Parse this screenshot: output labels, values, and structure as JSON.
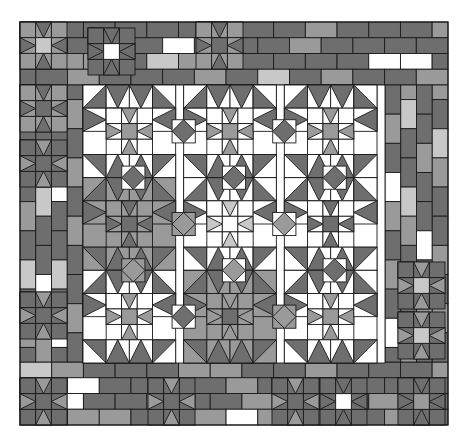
{
  "artwork": {
    "title": "Patchwork Quilt Pattern",
    "type": "quilt-diagram",
    "canvas": {
      "width": 467,
      "height": 442,
      "background": "#ffffff"
    },
    "quilt_bounds": {
      "x": 20,
      "y": 22,
      "width": 428,
      "height": 403
    }
  },
  "palette": {
    "white": "#ffffff",
    "light_gray": "#c8c8c8",
    "mid_gray": "#9a9a9a",
    "dark_gray": "#6e6e6e",
    "outline": "#1a1a1a",
    "names": [
      "white",
      "light_gray",
      "mid_gray",
      "dark_gray"
    ]
  },
  "layout": {
    "border": {
      "name": "brick-rail-border",
      "thickness": 63,
      "top_rows": 4,
      "bottom_rows": 4,
      "left_cols": 4,
      "right_cols": 4,
      "brick_long": 31.5,
      "brick_short": 15.7
    },
    "center": {
      "name": "nine-block-star-field",
      "x": 83,
      "y": 85,
      "width": 302,
      "height": 278,
      "rows": 3,
      "cols": 3,
      "block_size": 100.6,
      "block_name": "star-in-star-block",
      "sub_grid": 4
    },
    "accent_stars": {
      "name": "sawtooth-star-block",
      "size": 47,
      "count": 13,
      "positions": [
        {
          "x": 20,
          "y": 22,
          "body": "mid_gray",
          "star": "light_gray",
          "pts": "dark_gray"
        },
        {
          "x": 88,
          "y": 28,
          "body": "dark_gray",
          "star": "white",
          "pts": "dark_gray"
        },
        {
          "x": 196,
          "y": 22,
          "body": "mid_gray",
          "star": "dark_gray",
          "pts": "dark_gray"
        },
        {
          "x": 20,
          "y": 85,
          "body": "mid_gray",
          "star": "dark_gray",
          "pts": "dark_gray"
        },
        {
          "x": 20,
          "y": 140,
          "body": "dark_gray",
          "star": "dark_gray",
          "pts": "mid_gray"
        },
        {
          "x": 20,
          "y": 292,
          "body": "dark_gray",
          "star": "dark_gray",
          "pts": "mid_gray"
        },
        {
          "x": 398,
          "y": 262,
          "body": "dark_gray",
          "star": "light_gray",
          "pts": "mid_gray"
        },
        {
          "x": 398,
          "y": 312,
          "body": "dark_gray",
          "star": "light_gray",
          "pts": "mid_gray"
        },
        {
          "x": 398,
          "y": 378,
          "body": "dark_gray",
          "star": "mid_gray",
          "pts": "dark_gray"
        },
        {
          "x": 320,
          "y": 378,
          "body": "dark_gray",
          "star": "white",
          "pts": "dark_gray"
        },
        {
          "x": 272,
          "y": 378,
          "body": "dark_gray",
          "star": "dark_gray",
          "pts": "mid_gray"
        },
        {
          "x": 148,
          "y": 378,
          "body": "dark_gray",
          "star": "dark_gray",
          "pts": "mid_gray"
        },
        {
          "x": 20,
          "y": 378,
          "body": "dark_gray",
          "star": "dark_gray",
          "pts": "mid_gray"
        }
      ]
    }
  },
  "center_blocks": [
    {
      "row": 0,
      "col": 0,
      "ground": "white",
      "star_center": "mid_gray",
      "star_pts": "mid_gray",
      "geese": "dark_gray",
      "diamonds": "dark_gray",
      "corners": "white"
    },
    {
      "row": 0,
      "col": 1,
      "ground": "white",
      "star_center": "mid_gray",
      "star_pts": "mid_gray",
      "geese": "dark_gray",
      "diamonds": "dark_gray",
      "corners": "white"
    },
    {
      "row": 0,
      "col": 2,
      "ground": "white",
      "star_center": "mid_gray",
      "star_pts": "mid_gray",
      "geese": "dark_gray",
      "diamonds": "dark_gray",
      "corners": "white"
    },
    {
      "row": 1,
      "col": 0,
      "ground": "mid_gray",
      "star_center": "dark_gray",
      "star_pts": "dark_gray",
      "geese": "dark_gray",
      "diamonds": "mid_gray",
      "corners": "mid_gray"
    },
    {
      "row": 1,
      "col": 1,
      "ground": "white",
      "star_center": "white",
      "star_pts": "light_gray",
      "geese": "dark_gray",
      "diamonds": "mid_gray",
      "corners": "white"
    },
    {
      "row": 1,
      "col": 2,
      "ground": "white",
      "star_center": "dark_gray",
      "star_pts": "dark_gray",
      "geese": "dark_gray",
      "diamonds": "dark_gray",
      "corners": "white"
    },
    {
      "row": 2,
      "col": 0,
      "ground": "white",
      "star_center": "mid_gray",
      "star_pts": "mid_gray",
      "geese": "dark_gray",
      "diamonds": "dark_gray",
      "corners": "white"
    },
    {
      "row": 2,
      "col": 1,
      "ground": "mid_gray",
      "star_center": "dark_gray",
      "star_pts": "mid_gray",
      "geese": "dark_gray",
      "diamonds": "mid_gray",
      "corners": "mid_gray"
    },
    {
      "row": 2,
      "col": 2,
      "ground": "white",
      "star_center": "mid_gray",
      "star_pts": "mid_gray",
      "geese": "dark_gray",
      "diamonds": "dark_gray",
      "corners": "white"
    }
  ],
  "border_bricks": {
    "top": [
      [
        "mid_gray",
        "dark_gray",
        "dark_gray",
        "dark_gray",
        "dark_gray",
        "dark_gray",
        "mid_gray",
        "dark_gray",
        "dark_gray",
        "mid_gray",
        "dark_gray",
        "dark_gray",
        "dark_gray",
        "mid_gray"
      ],
      [
        "dark_gray",
        "dark_gray",
        "dark_gray",
        "mid_gray",
        "dark_gray",
        "white",
        "light_gray",
        "dark_gray",
        "dark_gray",
        "mid_gray",
        "dark_gray",
        "dark_gray",
        "dark_gray",
        "dark_gray"
      ],
      [
        "dark_gray",
        "mid_gray",
        "mid_gray",
        "dark_gray",
        "light_gray",
        "mid_gray",
        "light_gray",
        "dark_gray",
        "dark_gray",
        "dark_gray",
        "dark_gray",
        "white",
        "white",
        "dark_gray"
      ],
      [
        "dark_gray",
        "dark_gray",
        "mid_gray",
        "dark_gray",
        "dark_gray",
        "dark_gray",
        "mid_gray",
        "dark_gray",
        "light_gray",
        "dark_gray",
        "mid_gray",
        "dark_gray",
        "dark_gray",
        "mid_gray"
      ]
    ],
    "bottom": [
      [
        "light_gray",
        "mid_gray",
        "dark_gray",
        "dark_gray",
        "dark_gray",
        "mid_gray",
        "mid_gray",
        "dark_gray",
        "dark_gray",
        "mid_gray",
        "dark_gray",
        "dark_gray",
        "dark_gray",
        "mid_gray"
      ],
      [
        "dark_gray",
        "dark_gray",
        "white",
        "dark_gray",
        "dark_gray",
        "white",
        "dark_gray",
        "mid_gray",
        "dark_gray",
        "dark_gray",
        "white",
        "dark_gray",
        "dark_gray",
        "dark_gray"
      ],
      [
        "dark_gray",
        "white",
        "dark_gray",
        "dark_gray",
        "light_gray",
        "dark_gray",
        "dark_gray",
        "mid_gray",
        "light_gray",
        "dark_gray",
        "dark_gray",
        "mid_gray",
        "dark_gray",
        "dark_gray"
      ],
      [
        "mid_gray",
        "dark_gray",
        "mid_gray",
        "mid_gray",
        "dark_gray",
        "light_gray",
        "mid_gray",
        "white",
        "mid_gray",
        "dark_gray",
        "mid_gray",
        "dark_gray",
        "mid_gray",
        "dark_gray"
      ]
    ],
    "left": [
      [
        "mid_gray",
        "dark_gray",
        "light_gray",
        "dark_gray",
        "mid_gray",
        "dark_gray",
        "light_gray",
        "dark_gray",
        "mid_gray",
        "dark_gray"
      ],
      [
        "dark_gray",
        "mid_gray",
        "dark_gray",
        "mid_gray",
        "light_gray",
        "dark_gray",
        "dark_gray",
        "white",
        "dark_gray",
        "mid_gray"
      ],
      [
        "white",
        "dark_gray",
        "dark_gray",
        "white",
        "dark_gray",
        "dark_gray",
        "light_gray",
        "dark_gray",
        "white",
        "dark_gray"
      ],
      [
        "dark_gray",
        "mid_gray",
        "dark_gray",
        "mid_gray",
        "dark_gray",
        "mid_gray",
        "dark_gray",
        "dark_gray",
        "mid_gray",
        "dark_gray"
      ]
    ],
    "right": [
      [
        "dark_gray",
        "mid_gray",
        "dark_gray",
        "white",
        "mid_gray",
        "dark_gray",
        "mid_gray",
        "dark_gray",
        "white",
        "dark_gray"
      ],
      [
        "mid_gray",
        "light_gray",
        "dark_gray",
        "dark_gray",
        "light_gray",
        "mid_gray",
        "dark_gray",
        "light_gray",
        "dark_gray",
        "mid_gray"
      ],
      [
        "dark_gray",
        "dark_gray",
        "mid_gray",
        "dark_gray",
        "dark_gray",
        "white",
        "dark_gray",
        "mid_gray",
        "dark_gray",
        "dark_gray"
      ],
      [
        "mid_gray",
        "dark_gray",
        "light_gray",
        "mid_gray",
        "dark_gray",
        "dark_gray",
        "mid_gray",
        "dark_gray",
        "mid_gray",
        "dark_gray"
      ]
    ]
  }
}
